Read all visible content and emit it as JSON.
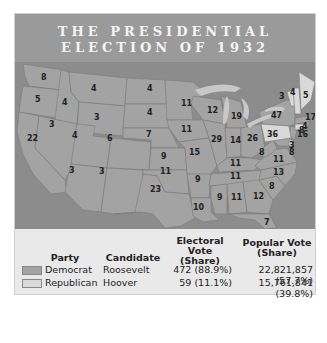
{
  "title": {
    "line1": "THE PRESIDENTIAL",
    "line2": "ELECTION OF 1932"
  },
  "colors": {
    "democrat": "#a3a3a3",
    "republican": "#d9d9d9",
    "water": "#8c8c8c",
    "header": "#9a9a9a"
  },
  "map": {
    "states": [
      {
        "state": "WA",
        "ev": "8",
        "party": "democrat"
      },
      {
        "state": "OR",
        "ev": "5",
        "party": "democrat"
      },
      {
        "state": "CA",
        "ev": "22",
        "party": "democrat"
      },
      {
        "state": "ID",
        "ev": "4",
        "party": "democrat"
      },
      {
        "state": "NV",
        "ev": "3",
        "party": "democrat"
      },
      {
        "state": "MT",
        "ev": "4",
        "party": "democrat"
      },
      {
        "state": "WY",
        "ev": "3",
        "party": "democrat"
      },
      {
        "state": "UT",
        "ev": "4",
        "party": "democrat"
      },
      {
        "state": "CO",
        "ev": "6",
        "party": "democrat"
      },
      {
        "state": "AZ",
        "ev": "3",
        "party": "democrat"
      },
      {
        "state": "NM",
        "ev": "3",
        "party": "democrat"
      },
      {
        "state": "ND",
        "ev": "4",
        "party": "democrat"
      },
      {
        "state": "SD",
        "ev": "4",
        "party": "democrat"
      },
      {
        "state": "NE",
        "ev": "7",
        "party": "democrat"
      },
      {
        "state": "KS",
        "ev": "9",
        "party": "democrat"
      },
      {
        "state": "OK",
        "ev": "11",
        "party": "democrat"
      },
      {
        "state": "TX",
        "ev": "23",
        "party": "democrat"
      },
      {
        "state": "MN",
        "ev": "11",
        "party": "democrat"
      },
      {
        "state": "IA",
        "ev": "11",
        "party": "democrat"
      },
      {
        "state": "MO",
        "ev": "15",
        "party": "democrat"
      },
      {
        "state": "AR",
        "ev": "9",
        "party": "democrat"
      },
      {
        "state": "LA",
        "ev": "10",
        "party": "democrat"
      },
      {
        "state": "WI",
        "ev": "12",
        "party": "democrat"
      },
      {
        "state": "IL",
        "ev": "29",
        "party": "democrat"
      },
      {
        "state": "MI",
        "ev": "19",
        "party": "democrat"
      },
      {
        "state": "IN",
        "ev": "14",
        "party": "democrat"
      },
      {
        "state": "OH",
        "ev": "26",
        "party": "democrat"
      },
      {
        "state": "KY",
        "ev": "11",
        "party": "democrat"
      },
      {
        "state": "TN",
        "ev": "11",
        "party": "democrat"
      },
      {
        "state": "MS",
        "ev": "9",
        "party": "democrat"
      },
      {
        "state": "AL",
        "ev": "11",
        "party": "democrat"
      },
      {
        "state": "GA",
        "ev": "12",
        "party": "democrat"
      },
      {
        "state": "FL",
        "ev": "7",
        "party": "democrat"
      },
      {
        "state": "SC",
        "ev": "8",
        "party": "democrat"
      },
      {
        "state": "NC",
        "ev": "13",
        "party": "democrat"
      },
      {
        "state": "VA",
        "ev": "11",
        "party": "democrat"
      },
      {
        "state": "WV",
        "ev": "8",
        "party": "democrat"
      },
      {
        "state": "MD",
        "ev": "8",
        "party": "democrat"
      },
      {
        "state": "DE",
        "ev": "3",
        "party": "republican"
      },
      {
        "state": "PA",
        "ev": "36",
        "party": "republican"
      },
      {
        "state": "NJ",
        "ev": "16",
        "party": "democrat"
      },
      {
        "state": "NY",
        "ev": "47",
        "party": "democrat"
      },
      {
        "state": "CT",
        "ev": "8",
        "party": "republican"
      },
      {
        "state": "RI",
        "ev": "4",
        "party": "democrat"
      },
      {
        "state": "MA",
        "ev": "17",
        "party": "democrat"
      },
      {
        "state": "VT",
        "ev": "3",
        "party": "republican"
      },
      {
        "state": "NH",
        "ev": "4",
        "party": "republican"
      },
      {
        "state": "ME",
        "ev": "5",
        "party": "republican"
      }
    ]
  },
  "legend": {
    "headers": {
      "party": "Party",
      "candidate": "Candidate",
      "ev_line1": "Electoral Vote",
      "ev_line2": "(Share)",
      "pv_line1": "Popular Vote",
      "pv_line2": "(Share)"
    },
    "rows": [
      {
        "party": "Democrat",
        "candidate": "Roosevelt",
        "electoral": "472 (88.9%)",
        "popular": "22,821,857 (57.7%)"
      },
      {
        "party": "Republican",
        "candidate": "Hoover",
        "electoral": "59 (11.1%)",
        "popular": "15,761,841 (39.8%)"
      }
    ]
  }
}
